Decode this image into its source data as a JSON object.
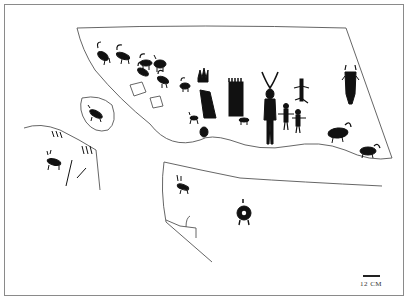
{
  "figure": {
    "colors": {
      "ink": "#111111",
      "outline": "#555555",
      "frame": "#8a8a8a",
      "background": "#ffffff"
    },
    "scale_bar": {
      "label": "12 CM"
    },
    "panels": [
      {
        "name": "upper-main-panel",
        "motifs": [
          "bighorn-sheep-herd",
          "hand-print-motifs",
          "fringed-block",
          "horned-anthropomorph",
          "small-anthropomorphs",
          "lizard-figure",
          "tailed-anthropomorph",
          "quadrupeds"
        ]
      },
      {
        "name": "oval-boulder",
        "motifs": [
          "quadruped"
        ]
      },
      {
        "name": "left-ledge",
        "motifs": [
          "quadruped",
          "grooves"
        ]
      },
      {
        "name": "lower-panel",
        "motifs": [
          "quadruped",
          "concentric-shield-figure",
          "hook-mark"
        ]
      }
    ]
  }
}
